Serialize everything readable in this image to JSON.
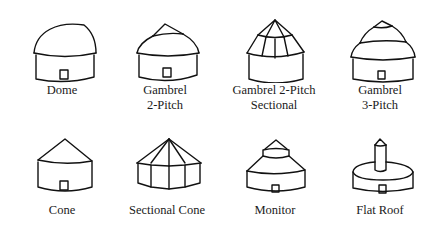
{
  "items": [
    {
      "label_line1": "Dome",
      "label_line2": ""
    },
    {
      "label_line1": "Gambrel",
      "label_line2": "2-Pitch"
    },
    {
      "label_line1": "Gambrel 2-Pitch",
      "label_line2": "Sectional"
    },
    {
      "label_line1": "Gambrel",
      "label_line2": "3-Pitch"
    },
    {
      "label_line1": "Cone",
      "label_line2": ""
    },
    {
      "label_line1": "Sectional Cone",
      "label_line2": ""
    },
    {
      "label_line1": "Monitor",
      "label_line2": ""
    },
    {
      "label_line1": "Flat Roof",
      "label_line2": ""
    }
  ]
}
